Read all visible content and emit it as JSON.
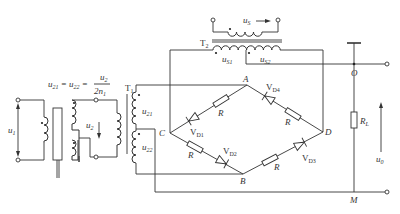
{
  "diagram": {
    "type": "phase-sensitive rectifier bridge circuit",
    "formula": {
      "lhs": "u",
      "lhs_sub1": "21",
      "mid_sub": "22",
      "numerator": "u",
      "numerator_sub": "2",
      "denominator": "2n",
      "denominator_sub": "1",
      "text": "u21 = u22 = u2 / 2n1"
    },
    "transformers": {
      "t1": {
        "label": "T",
        "sub": "1"
      },
      "t2": {
        "label": "T",
        "sub": "2"
      }
    },
    "signals": {
      "u1": {
        "label": "u",
        "sub": "1"
      },
      "u2": {
        "label": "u",
        "sub": "2"
      },
      "u21": {
        "label": "u",
        "sub": "21"
      },
      "u22": {
        "label": "u",
        "sub": "22"
      },
      "us": {
        "label": "u",
        "sub": "S"
      },
      "us1": {
        "label": "u",
        "sub": "S1"
      },
      "us2": {
        "label": "u",
        "sub": "S2"
      },
      "u0": {
        "label": "u",
        "sub": "0"
      }
    },
    "nodes": {
      "A": "A",
      "B": "B",
      "C": "C",
      "D": "D",
      "O": "O",
      "M": "M"
    },
    "components": {
      "resistor": "R",
      "load": {
        "label": "R",
        "sub": "L"
      },
      "vd1": {
        "label": "V",
        "sub": "D1"
      },
      "vd2": {
        "label": "V",
        "sub": "D2"
      },
      "vd3": {
        "label": "V",
        "sub": "D3"
      },
      "vd4": {
        "label": "V",
        "sub": "D4"
      }
    }
  }
}
